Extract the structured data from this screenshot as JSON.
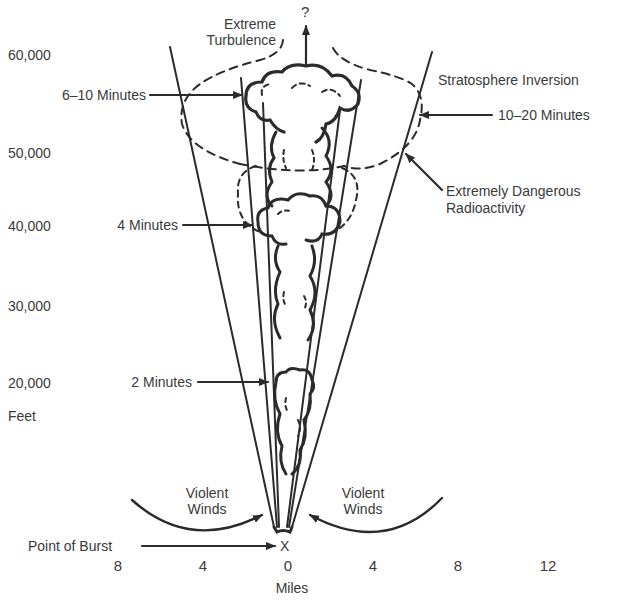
{
  "diagram": {
    "y_axis": {
      "unit_label": "Feet",
      "ticks": [
        "60,000",
        "50,000",
        "40,000",
        "30,000",
        "20,000"
      ]
    },
    "x_axis": {
      "unit_label": "Miles",
      "ticks": [
        "8",
        "4",
        "0",
        "4",
        "8",
        "12"
      ]
    },
    "annotations": {
      "question_mark": "?",
      "extreme_turbulence_line1": "Extreme",
      "extreme_turbulence_line2": "Turbulence",
      "stratosphere_inversion": "Stratosphere Inversion",
      "six_to_ten_minutes": "6–10 Minutes",
      "ten_to_twenty_minutes": "10–20 Minutes",
      "dangerous_line1": "Extremely Dangerous",
      "dangerous_line2": "Radioactivity",
      "four_minutes": "4 Minutes",
      "two_minutes": "2 Minutes",
      "violent_winds_left_line1": "Violent",
      "violent_winds_left_line2": "Winds",
      "violent_winds_right_line1": "Violent",
      "violent_winds_right_line2": "Winds",
      "point_of_burst": "Point of Burst",
      "burst_marker": "X"
    },
    "colors": {
      "ink": "#2b2b2b",
      "text": "#3a3a3a",
      "background": "#ffffff"
    }
  }
}
